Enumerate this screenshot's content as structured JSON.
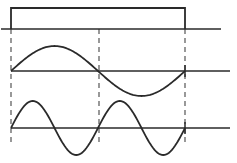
{
  "diagram": {
    "description": "Rectangular pulse with fundamental and second-harmonic sine components",
    "stroke_color": "#2a2a2a",
    "background": "#ffffff",
    "pulse": {
      "baseline_y": 29,
      "baseline_x": [
        1,
        221
      ],
      "top_y": 8,
      "start_x": 11,
      "end_x": 185
    },
    "waves": [
      {
        "name": "fundamental",
        "baseline_y": 71,
        "baseline_x": [
          11,
          230
        ],
        "start_x": 11,
        "end_x": 185,
        "cycles": 1,
        "amplitude": 25
      },
      {
        "name": "second-harmonic",
        "baseline_y": 128,
        "baseline_x": [
          11,
          230
        ],
        "start_x": 11,
        "end_x": 185,
        "cycles": 2,
        "amplitude": 27
      }
    ],
    "guides": [
      {
        "x": 11,
        "y1": 29,
        "y2": 143
      },
      {
        "x": 99,
        "y1": 29,
        "y2": 143
      },
      {
        "x": 185,
        "y1": 29,
        "y2": 143
      }
    ]
  }
}
